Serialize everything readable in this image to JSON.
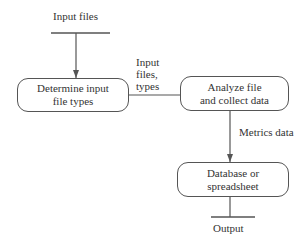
{
  "diagram": {
    "type": "flowchart",
    "source": {
      "label": "Input files"
    },
    "nodes": [
      {
        "id": "determine",
        "line1": "Determine input",
        "line2": "file types"
      },
      {
        "id": "analyze",
        "line1": "Analyze file",
        "line2": "and collect data"
      },
      {
        "id": "database",
        "line1": "Database or",
        "line2": "spreadsheet"
      }
    ],
    "edges": [
      {
        "from": "source",
        "to": "determine",
        "label": "",
        "arrow": true
      },
      {
        "from": "determine",
        "to": "analyze",
        "label_lines": [
          "Input",
          "files,",
          "types"
        ],
        "arrow": false
      },
      {
        "from": "analyze",
        "to": "database",
        "label": "Metrics data",
        "arrow": true
      },
      {
        "from": "database",
        "to": "sink",
        "label": "",
        "arrow": false
      }
    ],
    "sink": {
      "label": "Output"
    },
    "colors": {
      "line": "#555555",
      "text": "#333333",
      "background": "#ffffff"
    }
  }
}
